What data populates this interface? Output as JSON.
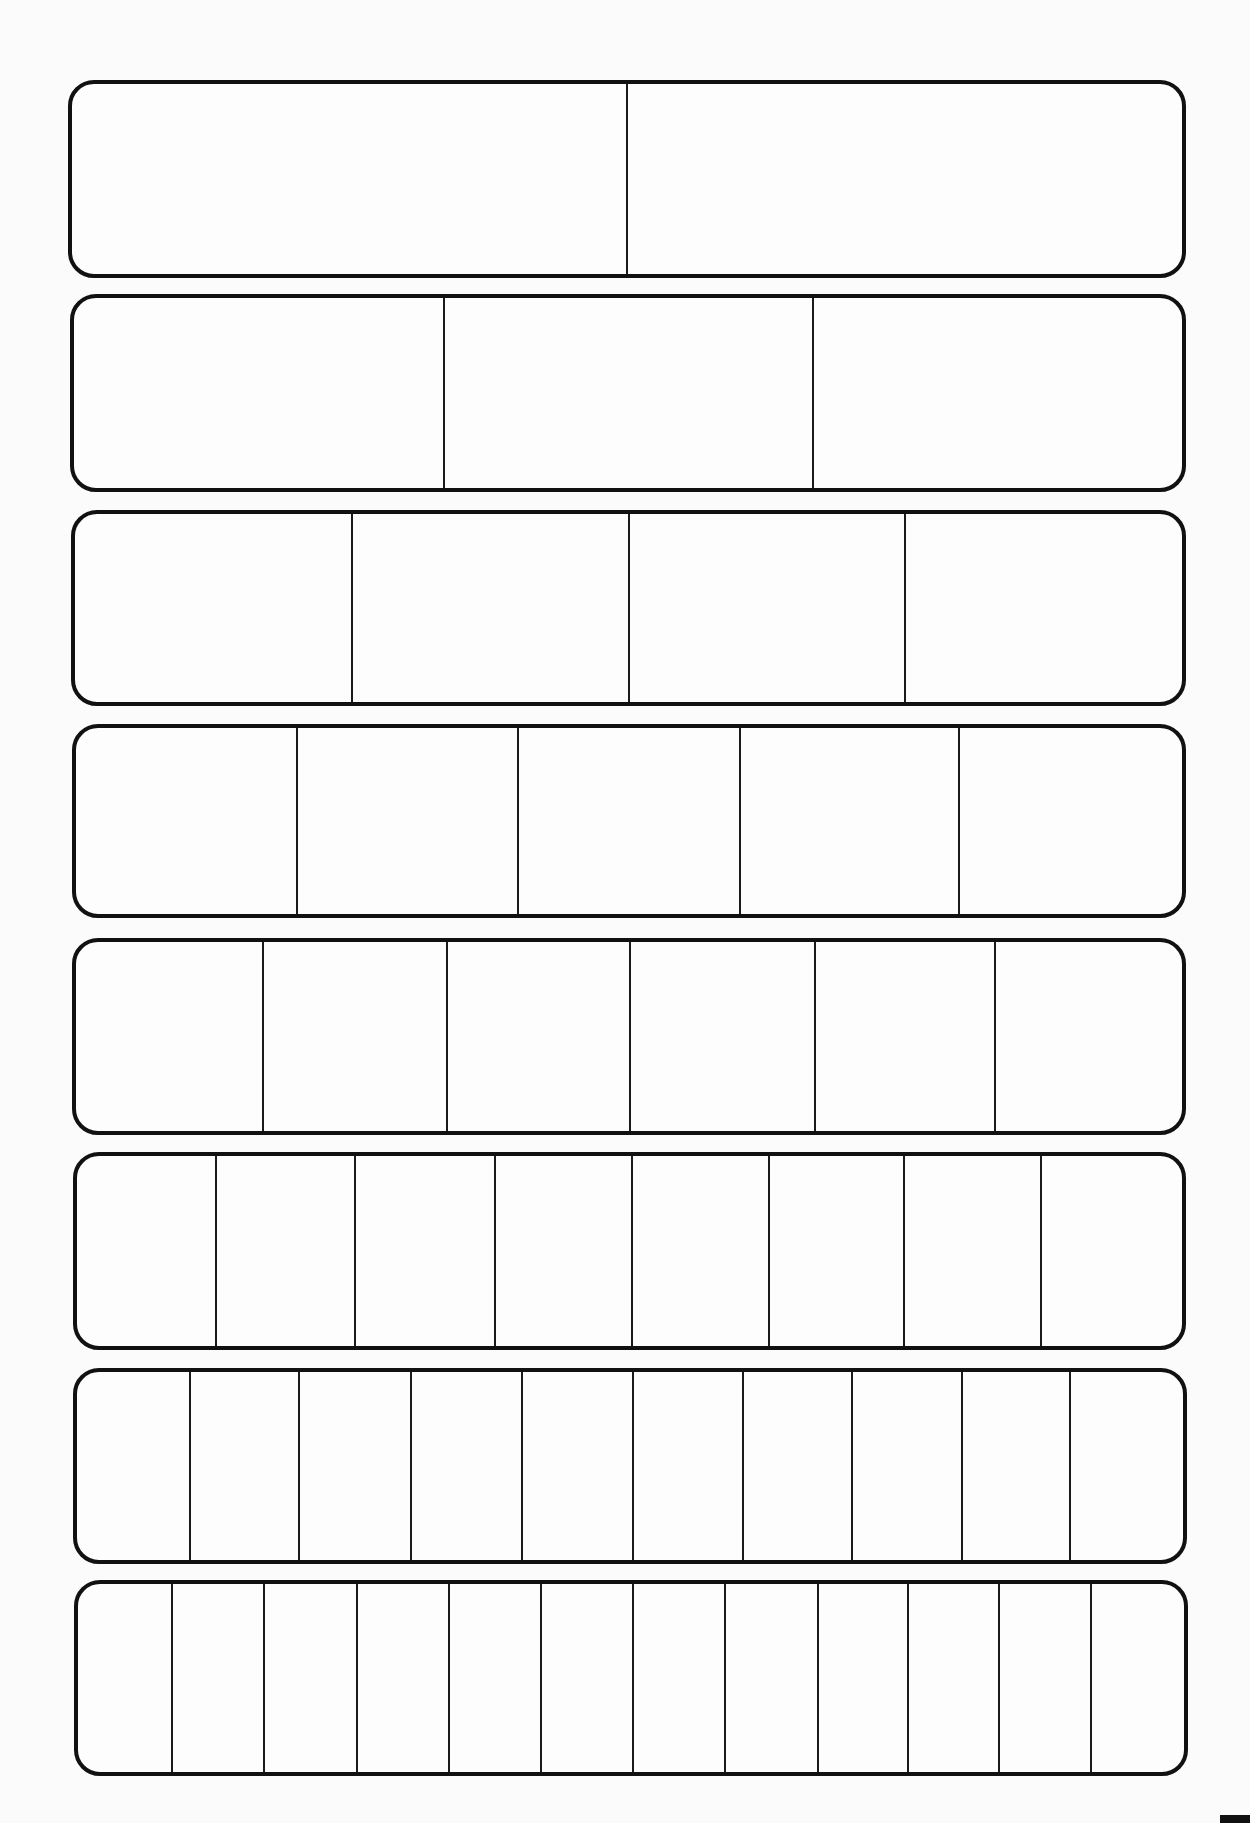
{
  "worksheet": {
    "title": "",
    "strips": [
      {
        "parts": 2,
        "label": "halves",
        "box": {
          "left": 68,
          "top": 80,
          "width": 1118,
          "height": 198
        },
        "dividers_pct": [
          50.0
        ]
      },
      {
        "parts": 3,
        "label": "thirds",
        "box": {
          "left": 70,
          "top": 294,
          "width": 1116,
          "height": 198
        },
        "dividers_pct": [
          33.4,
          66.7
        ]
      },
      {
        "parts": 4,
        "label": "fourths",
        "box": {
          "left": 71,
          "top": 510,
          "width": 1115,
          "height": 196
        },
        "dividers_pct": [
          25.0,
          50.0,
          75.0
        ]
      },
      {
        "parts": 5,
        "label": "fifths",
        "box": {
          "left": 72,
          "top": 724,
          "width": 1114,
          "height": 194
        },
        "dividers_pct": [
          20.0,
          40.0,
          60.0,
          79.8
        ]
      },
      {
        "parts": 6,
        "label": "sixths",
        "box": {
          "left": 72,
          "top": 938,
          "width": 1114,
          "height": 197
        },
        "dividers_pct": [
          16.9,
          33.5,
          50.1,
          66.8,
          83.1
        ]
      },
      {
        "parts": 8,
        "label": "eighths",
        "box": {
          "left": 73,
          "top": 1152,
          "width": 1113,
          "height": 198
        },
        "dividers_pct": [
          12.6,
          25.2,
          37.8,
          50.2,
          62.6,
          74.8,
          87.2
        ]
      },
      {
        "parts": 10,
        "label": "tenths",
        "box": {
          "left": 73,
          "top": 1368,
          "width": 1114,
          "height": 196
        },
        "dividers_pct": [
          10.2,
          20.1,
          30.2,
          40.2,
          50.3,
          60.2,
          70.1,
          80.0,
          89.8
        ]
      },
      {
        "parts": 12,
        "label": "twelfths",
        "box": {
          "left": 74,
          "top": 1580,
          "width": 1114,
          "height": 196
        },
        "dividers_pct": [
          8.5,
          16.8,
          25.2,
          33.5,
          41.9,
          50.2,
          58.5,
          66.9,
          75.0,
          83.3,
          91.6
        ]
      }
    ]
  },
  "colors": {
    "line": "#111111",
    "paper": "#fbfbfb"
  }
}
